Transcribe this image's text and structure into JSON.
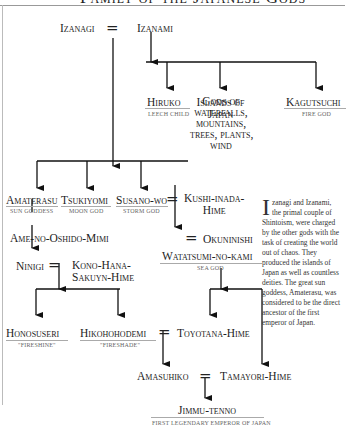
{
  "title": "Family of the Japanese Gods",
  "nodes": {
    "izanagi": "Izanagi",
    "izanami": "Izanami",
    "hiruko": {
      "name": "Hiruko",
      "sub": "Leech child"
    },
    "islands": "Islands of Japan",
    "gods_of": "Gods of waterfalls, mountains, trees, plants, wind",
    "gods_lines": [
      "Gods of",
      "waterfalls,",
      "mountains,",
      "trees, plants,",
      "wind"
    ],
    "kagutsuchi": {
      "name": "Kagutsuchi",
      "sub": "Fire god"
    },
    "amaterasu": {
      "name": "Amaterasu",
      "sub": "Sun goddess"
    },
    "tsukiyomi": {
      "name": "Tsukiyomi",
      "sub": "Moon god"
    },
    "susanowo": {
      "name": "Susano-wo",
      "sub": "Storm god"
    },
    "kushi": [
      "Kushi-inada-",
      "Hime"
    ],
    "ame": "Ame-no-Oshido-Mimi",
    "suseri": "Suseri-Hime",
    "okuninishi": "Okuninishi",
    "ninigi": "Ninigi",
    "kono": [
      "Kono-Hana-",
      "Sakuyn-Hime"
    ],
    "watatsumi": {
      "name": "Watatsumi-no-kami",
      "sub": "Sea god"
    },
    "honosuseri": {
      "name": "Honosuseri",
      "sub": "\"Fireshine\""
    },
    "hikohohodemi": {
      "name": "Hikohohodemi",
      "sub": "\"Fireshade\""
    },
    "toyotana": "Toyotana-Hime",
    "amasuhiko": "Amasuhiko",
    "tamayori": "Tamayori-Hime",
    "jimmu": {
      "name": "Jimmu-tenno",
      "sub": "First legendary emperor of Japan"
    }
  },
  "marriage_symbol": "=",
  "sidebar": {
    "drop_cap": "I",
    "text": "zanagi and Izanami, the primal couple of Shintoism, were charged by the other gods with the task of creating the world out of chaos. They produced the islands of Japan as well as countless deities. The great sun goddess, Amaterasu, was considered to be the direct ancestor of the first emperor of Japan."
  }
}
